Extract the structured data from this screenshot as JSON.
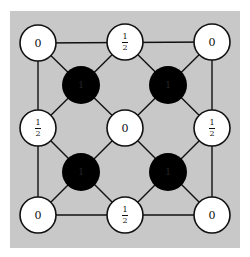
{
  "diagram": {
    "background_color": "#c8c8c8",
    "edge_color": "#111111",
    "white_node_fill": "#ffffff",
    "black_node_fill": "#000000",
    "white_nodes": [
      {
        "id": "top-left",
        "cx": 38,
        "cy": 43,
        "label": "0",
        "fraction": false
      },
      {
        "id": "top-middle",
        "cx": 125,
        "cy": 42,
        "label": "1/2",
        "num": "1",
        "den": "2",
        "fraction": true
      },
      {
        "id": "top-right",
        "cx": 212,
        "cy": 42,
        "label": "0",
        "fraction": false
      },
      {
        "id": "middle-left",
        "cx": 38,
        "cy": 128,
        "label": "1/2",
        "num": "1",
        "den": "2",
        "fraction": true
      },
      {
        "id": "center",
        "cx": 125,
        "cy": 128,
        "label": "0",
        "fraction": false
      },
      {
        "id": "middle-right",
        "cx": 212,
        "cy": 128,
        "label": "1/2",
        "num": "1",
        "den": "2",
        "fraction": true
      },
      {
        "id": "bottom-left",
        "cx": 38,
        "cy": 215,
        "label": "0",
        "fraction": false
      },
      {
        "id": "bottom-middle",
        "cx": 125,
        "cy": 215,
        "label": "1/2",
        "num": "1",
        "den": "2",
        "fraction": true
      },
      {
        "id": "bottom-right",
        "cx": 212,
        "cy": 215,
        "label": "0",
        "fraction": false
      }
    ],
    "black_nodes": [
      {
        "id": "upper-left-black",
        "cx": 81,
        "cy": 85,
        "label": "1"
      },
      {
        "id": "upper-right-black",
        "cx": 168,
        "cy": 85,
        "label": "1"
      },
      {
        "id": "lower-left-black",
        "cx": 81,
        "cy": 172,
        "label": "1"
      },
      {
        "id": "lower-right-black",
        "cx": 168,
        "cy": 172,
        "label": "1"
      }
    ]
  }
}
